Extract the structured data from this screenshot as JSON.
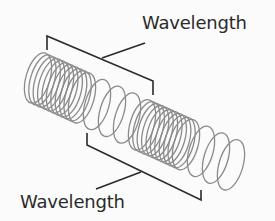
{
  "diagram": {
    "labels": {
      "top": "Wavelength",
      "bottom": "Wavelength"
    },
    "colors": {
      "coil": "#8a8a8a",
      "bracket": "#2a2a2a",
      "text": "#2a2a2a",
      "background": "#fbfbfb"
    },
    "spring": {
      "compressions": 2,
      "axis_start": [
        38,
        78
      ],
      "axis_end": [
        238,
        168
      ]
    }
  }
}
